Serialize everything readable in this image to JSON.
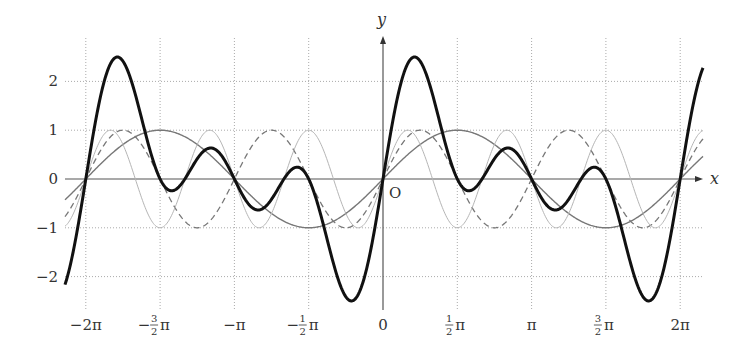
{
  "chart_data": {
    "type": "line",
    "title": "",
    "xlabel": "x",
    "ylabel": "y",
    "origin_label": "O",
    "xlim": [
      -6.6,
      6.65
    ],
    "ylim": [
      -2.45,
      2.5
    ],
    "grid": true,
    "legend": null,
    "x_ticks": [
      {
        "value": -6.283185,
        "label": "−2π"
      },
      {
        "value": -4.712389,
        "label": "−",
        "num": "3",
        "den": "2",
        "suffix": "π"
      },
      {
        "value": -3.141593,
        "label": "−π"
      },
      {
        "value": -1.570796,
        "label": "−",
        "num": "1",
        "den": "2",
        "suffix": "π"
      },
      {
        "value": 0,
        "label": "0"
      },
      {
        "value": 1.570796,
        "label": "",
        "num": "1",
        "den": "2",
        "suffix": "π"
      },
      {
        "value": 3.141593,
        "label": "π"
      },
      {
        "value": 4.712389,
        "label": "",
        "num": "3",
        "den": "2",
        "suffix": "π"
      },
      {
        "value": 6.283185,
        "label": "2π"
      }
    ],
    "y_ticks": [
      {
        "value": 2,
        "label": "2"
      },
      {
        "value": 1,
        "label": "1"
      },
      {
        "value": 0,
        "label": "0"
      },
      {
        "value": -1,
        "label": "−1"
      },
      {
        "value": -2,
        "label": "−2"
      }
    ],
    "series": [
      {
        "name": "sin x",
        "expr": "sin(x)",
        "color": "#777777",
        "width": 1.4,
        "dash": ""
      },
      {
        "name": "sin 2x",
        "expr": "sin(2x)",
        "color": "#777777",
        "width": 1.3,
        "dash": "6,4"
      },
      {
        "name": "sin 3x",
        "expr": "sin(3x)",
        "color": "#b5b5b5",
        "width": 1.0,
        "dash": ""
      },
      {
        "name": "sin x + sin 2x + sin 3x",
        "expr": "sin(x)+sin(2x)+sin(3x)",
        "color": "#111111",
        "width": 3.0,
        "dash": ""
      }
    ],
    "sample_points": {
      "x": [
        -6.6,
        -6.283,
        -5.64,
        -4.712,
        -3.927,
        -3.142,
        -2.5,
        -1.571,
        -0.64,
        0,
        0.64,
        1.571,
        2.5,
        3.142,
        3.927,
        4.712,
        5.64,
        6.283,
        6.65
      ],
      "sum_values": [
        -2.35,
        0,
        2.5,
        -0.0,
        0.29,
        0,
        -0.6,
        0,
        -2.5,
        0,
        2.5,
        0,
        0.6,
        0,
        -0.29,
        0,
        -2.5,
        0,
        2.4
      ]
    }
  },
  "layout": {
    "plot_left": 65,
    "plot_right": 703,
    "origin_x": 383,
    "origin_y": 179,
    "px_per_x": 47.3,
    "px_per_y": 48.8,
    "grid_top": 38,
    "grid_bottom": 310,
    "axis_arrow_right": 703,
    "axis_arrow_top": 36
  }
}
